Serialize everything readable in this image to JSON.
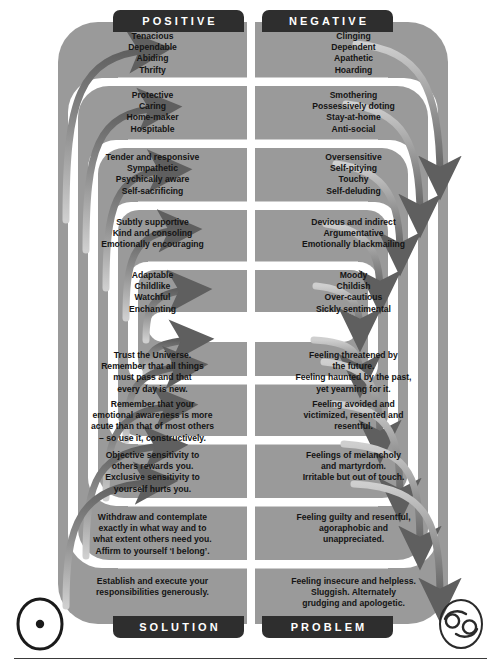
{
  "headers": {
    "positive": "POSITIVE",
    "negative": "NEGATIVE",
    "solution": "SOLUTION",
    "problem": "PROBLEM"
  },
  "symbols": {
    "left": "sun-symbol",
    "right": "cancer-symbol"
  },
  "colors": {
    "band": "#9a9a9a",
    "gap": "#ffffff",
    "tab": "#2e2e2e",
    "text": "#141414",
    "arrow_dark": "#6e6e6e",
    "arrow_light": "#b9b9b9"
  },
  "rows": [
    {
      "band": "gray",
      "positive": "Tenacious\nDependable\nAbiding\nThrifty",
      "negative": "Clinging\nDependent\nApathetic\nHoarding"
    },
    {
      "band": "white",
      "positive": "Protective\nCaring\nHome-maker\nHospitable",
      "negative": "Smothering\nPossessively doting\nStay-at-home\nAnti-social"
    },
    {
      "band": "gray",
      "positive": "Tender and responsive\nSympathetic\nPsychically aware\nSelf-sacrificing",
      "negative": "Oversensitive\nSelf-pitying\nTouchy\nSelf-deluding"
    },
    {
      "band": "white",
      "positive": "Subtly supportive\nKind and consoling\nEmotionally encouraging",
      "negative": "Devious and indirect\nArgumentative\nEmotionally blackmailing"
    },
    {
      "band": "gray",
      "positive": "Adaptable\nChildlike\nWatchful\nEnchanting",
      "negative": "Moody\nChildish\nOver-cautious\nSickly sentimental"
    },
    {
      "band": "white-empty",
      "positive": "",
      "negative": ""
    },
    {
      "band": "gray",
      "positive": "Trust the Universe.\nRemember that all things\nmust pass and that\nevery day is new.",
      "negative": "Feeling threatened by\nthe future.\nFeeling haunted by the past,\nyet yearning for it."
    },
    {
      "band": "white",
      "positive": "Remember that your\nemotional awareness is more\nacute than that of most others\n– so use it, constructively.",
      "negative": "Feeling avoided and\nvictimized, resented and\nresentful."
    },
    {
      "band": "gray",
      "positive": "Objective sensitivity to\nothers rewards you.\nExclusive sensitivity to\nyourself hurts you.",
      "negative": "Feelings of melancholy\nand martyrdom.\nIrritable but out of touch."
    },
    {
      "band": "white",
      "positive": "Withdraw and contemplate\nexactly in what way and to\nwhat extent others need you.\nAffirm to yourself ‘I belong’.",
      "negative": "Feeling guilty and resentful,\nagoraphobic and\nunappreciated."
    },
    {
      "band": "gray",
      "positive": "Establish and execute your\nresponsibilities generously.",
      "negative": "Feeling insecure and helpless.\nSluggish. Alternately\ngrudging and apologetic."
    }
  ]
}
